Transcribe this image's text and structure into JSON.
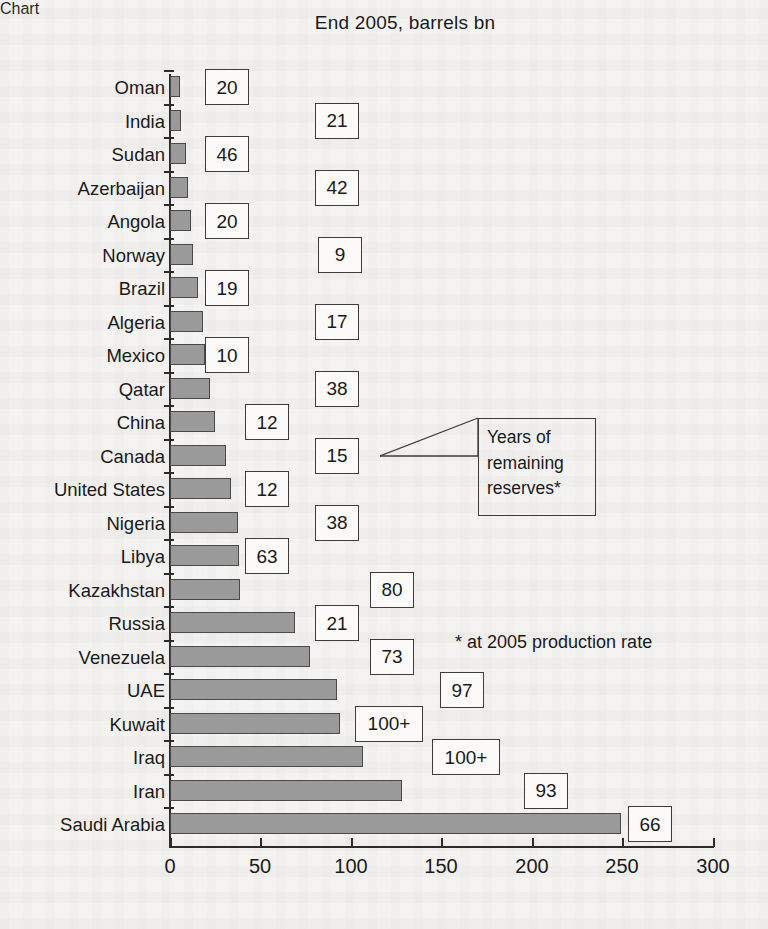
{
  "chart": {
    "title": "End 2005, barrels bn",
    "footnote": "* at 2005 production rate",
    "callout": {
      "line1": "Years of",
      "line2": "remaining",
      "line3": "reserves*"
    }
  },
  "chart_data": {
    "type": "bar",
    "orientation": "horizontal",
    "title": "End 2005, barrels bn",
    "xlabel": "",
    "ylabel": "",
    "xlim": [
      0,
      300
    ],
    "xticks": [
      "0",
      "50",
      "100",
      "150",
      "200",
      "250",
      "300"
    ],
    "grid": false,
    "legend": null,
    "annotations": [
      "Years of remaining reserves*",
      "* at 2005 production rate"
    ],
    "value_label_meaning": "Years of remaining reserves at 2005 production rate",
    "categories": [
      "Oman",
      "India",
      "Sudan",
      "Azerbaijan",
      "Angola",
      "Norway",
      "Brazil",
      "Algeria",
      "Mexico",
      "Qatar",
      "China",
      "Canada",
      "United States",
      "Nigeria",
      "Libya",
      "Kazakhstan",
      "Russia",
      "Venezuela",
      "UAE",
      "Kuwait",
      "Iraq",
      "Iran",
      "Saudi Arabia"
    ],
    "values": [
      5.5,
      5.9,
      6.4,
      7.0,
      9.0,
      9.7,
      11.2,
      12.3,
      13.7,
      15.2,
      16.0,
      16.5,
      21.4,
      35.9,
      39.1,
      39.6,
      39.6,
      74.9,
      79.7,
      97.8,
      101.5,
      115.2,
      137.5
    ],
    "bars_bn_barrels": [
      {
        "country": "Oman",
        "reserves": 5.5,
        "years": "20"
      },
      {
        "country": "India",
        "reserves": 5.9,
        "years": "21"
      },
      {
        "country": "Sudan",
        "reserves": 6.4,
        "years": "46"
      },
      {
        "country": "Azerbaijan",
        "reserves": 7.0,
        "years": "42"
      },
      {
        "country": "Angola",
        "reserves": 9.0,
        "years": "20"
      },
      {
        "country": "Norway",
        "reserves": 9.7,
        "years": "9"
      },
      {
        "country": "Brazil",
        "reserves": 11.2,
        "years": "19"
      },
      {
        "country": "Algeria",
        "reserves": 12.3,
        "years": "17"
      },
      {
        "country": "Mexico",
        "reserves": 13.7,
        "years": "10"
      },
      {
        "country": "Qatar",
        "reserves": 15.2,
        "years": "38"
      },
      {
        "country": "China",
        "reserves": 16.0,
        "years": "12"
      },
      {
        "country": "Canada",
        "reserves": 16.5,
        "years": "15"
      },
      {
        "country": "United States",
        "reserves": 21.4,
        "years": "12"
      },
      {
        "country": "Nigeria",
        "reserves": 35.9,
        "years": "38"
      },
      {
        "country": "Libya",
        "reserves": 39.1,
        "years": "63"
      },
      {
        "country": "Kazakhstan",
        "reserves": 39.6,
        "years": "80"
      },
      {
        "country": "Russia",
        "reserves": 74.4,
        "years": "21"
      },
      {
        "country": "Venezuela",
        "reserves": 79.7,
        "years": "73"
      },
      {
        "country": "UAE",
        "reserves": 97.8,
        "years": "97"
      },
      {
        "country": "Iraq",
        "reserves": 115.0,
        "years": "100+"
      },
      {
        "country": "Kuwait",
        "reserves": 101.5,
        "years": "100+"
      },
      {
        "country": "Iran",
        "reserves": 137.5,
        "years": "93"
      },
      {
        "country": "Saudi Arabia",
        "reserves": 264.2,
        "years": "66"
      }
    ],
    "colors": {
      "bar_fill": "#9a9a9a",
      "bar_stroke": "#4a4a4a",
      "axis": "#2b2b2b",
      "box_stroke": "#3d3d3d",
      "background": "#f4f3f1"
    }
  },
  "rows": [
    {
      "label": "Oman",
      "px_len": 10,
      "box_left": 205,
      "years": "20"
    },
    {
      "label": "India",
      "px_len": 11,
      "box_left": 315,
      "years": "21"
    },
    {
      "label": "Sudan",
      "px_len": 16,
      "box_left": 205,
      "years": "46"
    },
    {
      "label": "Azerbaijan",
      "px_len": 18,
      "box_left": 315,
      "years": "42"
    },
    {
      "label": "Angola",
      "px_len": 21,
      "box_left": 205,
      "years": "20"
    },
    {
      "label": "Norway",
      "px_len": 23,
      "box_left": 318,
      "years": "9"
    },
    {
      "label": "Brazil",
      "px_len": 28,
      "box_left": 205,
      "years": "19"
    },
    {
      "label": "Algeria",
      "px_len": 33,
      "box_left": 315,
      "years": "17"
    },
    {
      "label": "Mexico",
      "px_len": 35,
      "box_left": 205,
      "years": "10"
    },
    {
      "label": "Qatar",
      "px_len": 40,
      "box_left": 315,
      "years": "38"
    },
    {
      "label": "China",
      "px_len": 45,
      "box_left": 245,
      "years": "12"
    },
    {
      "label": "Canada",
      "px_len": 56,
      "box_left": 315,
      "years": "15"
    },
    {
      "label": "United States",
      "px_len": 61,
      "box_left": 245,
      "years": "12"
    },
    {
      "label": "Nigeria",
      "px_len": 68,
      "box_left": 315,
      "years": "38"
    },
    {
      "label": "Libya",
      "px_len": 69,
      "box_left": 245,
      "years": "63"
    },
    {
      "label": "Kazakhstan",
      "px_len": 70,
      "box_left": 370,
      "years": "80"
    },
    {
      "label": "Russia",
      "px_len": 125,
      "box_left": 315,
      "years": "21"
    },
    {
      "label": "Venezuela",
      "px_len": 140,
      "box_left": 370,
      "years": "73"
    },
    {
      "label": "UAE",
      "px_len": 167,
      "box_left": 440,
      "years": "97"
    },
    {
      "label": "Kuwait",
      "px_len": 170,
      "box_left": 355,
      "years": "100+"
    },
    {
      "label": "Iraq",
      "px_len": 193,
      "box_left": 432,
      "years": "100+"
    },
    {
      "label": "Iran",
      "px_len": 232,
      "box_left": 524,
      "years": "93"
    },
    {
      "label": "Saudi Arabia",
      "px_len": 451,
      "box_left": 628,
      "years": "66"
    }
  ],
  "axis": {
    "ticks": [
      {
        "label": "0",
        "x": 170
      },
      {
        "label": "50",
        "x": 260
      },
      {
        "label": "100",
        "x": 351
      },
      {
        "label": "150",
        "x": 441
      },
      {
        "label": "200",
        "x": 532
      },
      {
        "label": "250",
        "x": 622
      },
      {
        "label": "300",
        "x": 713
      }
    ]
  }
}
